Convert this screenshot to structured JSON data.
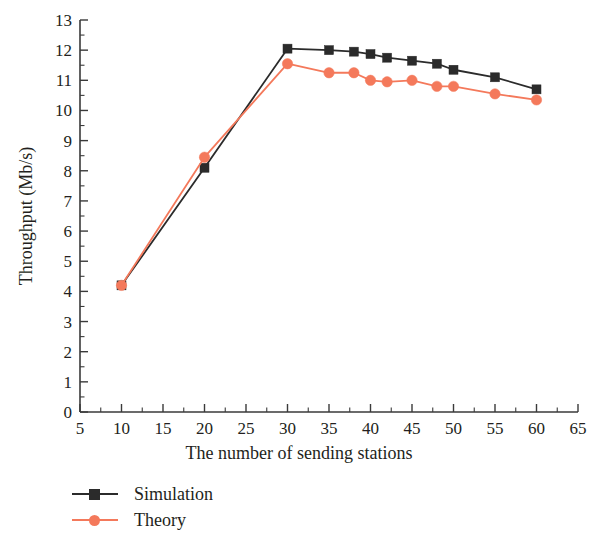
{
  "chart_data": {
    "type": "line",
    "title": "",
    "xlabel": "The number of sending stations",
    "ylabel": "Throughput (Mb/s)",
    "xlim": [
      5,
      65
    ],
    "ylim": [
      0,
      13
    ],
    "x_ticks": [
      5,
      10,
      15,
      20,
      25,
      30,
      35,
      40,
      45,
      50,
      55,
      60,
      65
    ],
    "y_ticks": [
      0,
      1,
      2,
      3,
      4,
      5,
      6,
      7,
      8,
      9,
      10,
      11,
      12,
      13
    ],
    "x_minor_tick_step": 2.5,
    "y_minor_tick_step": 0.5,
    "grid": false,
    "legend_position": "below-left",
    "x": [
      10,
      20,
      30,
      35,
      38,
      40,
      42,
      45,
      48,
      50,
      55,
      60
    ],
    "series": [
      {
        "name": "Simulation",
        "color": "#2b2b2b",
        "marker": "square",
        "values": [
          4.2,
          8.1,
          12.05,
          12.0,
          11.95,
          11.87,
          11.75,
          11.65,
          11.55,
          11.35,
          11.1,
          10.7
        ]
      },
      {
        "name": "Theory",
        "color": "#f4795b",
        "marker": "circle",
        "values": [
          4.2,
          8.45,
          11.55,
          11.25,
          11.25,
          11.0,
          10.95,
          11.0,
          10.8,
          10.8,
          10.55,
          10.35
        ]
      }
    ]
  },
  "axis": {
    "color": "#3a3a3a"
  },
  "legend": {
    "items": [
      {
        "label": "Simulation",
        "color": "#2b2b2b",
        "marker": "square"
      },
      {
        "label": "Theory",
        "color": "#f4795b",
        "marker": "circle"
      }
    ]
  }
}
